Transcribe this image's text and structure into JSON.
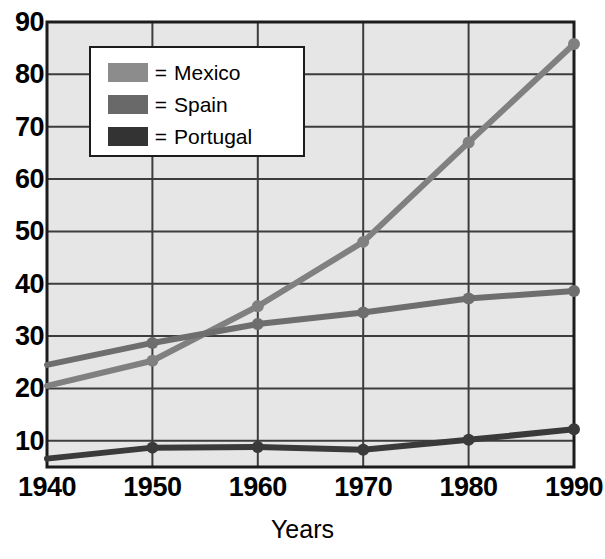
{
  "chart_data": {
    "type": "line",
    "title": "",
    "xlabel": "Years",
    "ylabel": "",
    "x": [
      1940,
      1950,
      1960,
      1970,
      1980,
      1990
    ],
    "xtick_labels": [
      "1940",
      "1950",
      "1960",
      "1970",
      "1980",
      "1990"
    ],
    "ytick_labels": [
      "10",
      "20",
      "30",
      "40",
      "50",
      "60",
      "70",
      "80",
      "90"
    ],
    "yticks": [
      10,
      20,
      30,
      40,
      50,
      60,
      70,
      80,
      90
    ],
    "xlim": [
      1940,
      1990
    ],
    "ylim": [
      5,
      90
    ],
    "grid": true,
    "legend_position": "upper-left-inside",
    "series": [
      {
        "name": "Mexico",
        "color": "#808080",
        "values": [
          20.5,
          25.3,
          35.7,
          48.0,
          67.0,
          85.8
        ]
      },
      {
        "name": "Spain",
        "color": "#6e6e6e",
        "values": [
          24.5,
          28.7,
          32.3,
          34.5,
          37.2,
          38.6
        ]
      },
      {
        "name": "Portugal",
        "color": "#3a3a3a",
        "values": [
          6.6,
          8.7,
          8.8,
          8.3,
          10.2,
          12.2
        ]
      }
    ]
  },
  "legend": {
    "equals_sign": "=",
    "entries": [
      {
        "label": "Mexico",
        "swatch_color": "#8c8c8c"
      },
      {
        "label": "Spain",
        "swatch_color": "#696969"
      },
      {
        "label": "Portugal",
        "swatch_color": "#333333"
      }
    ]
  },
  "axes": {
    "x_title": "Years",
    "x_ticks": [
      "1940",
      "1950",
      "1960",
      "1970",
      "1980",
      "1990"
    ],
    "y_ticks": [
      "90",
      "80",
      "70",
      "60",
      "50",
      "40",
      "30",
      "20",
      "10"
    ]
  },
  "style": {
    "plot_background": "#e6e6e6",
    "grid_color": "#3d3d3d",
    "axis_color": "#1c1c1c",
    "page_background": "#ffffff"
  }
}
